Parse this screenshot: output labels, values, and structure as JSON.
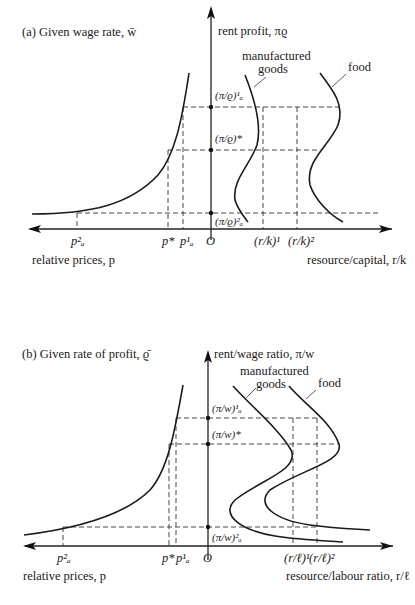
{
  "panel_a": {
    "title": "(a)  Given wage rate, w̄",
    "y_axis_label": "rent profit, πϱ",
    "x_right_label": "resource/capital, r/k",
    "x_left_label": "relative prices, p",
    "origin": "O",
    "curve_labels": {
      "manufactured_line1": "manufactured",
      "manufactured_line2": "goods",
      "food": "food"
    },
    "y_levels": {
      "upper": "(π/ϱ)¹ₐ",
      "star": "(π/ϱ)*",
      "lower": "(π/ϱ)²ₐ"
    },
    "x_left_ticks": {
      "pa2": "p²ₐ",
      "pstar": "p*",
      "pa1": "p¹ₐ"
    },
    "x_right_ticks": {
      "t1": "(r/k)¹",
      "t2": "(r/k)²"
    }
  },
  "panel_b": {
    "title": "(b)  Given rate of profit, ϱ̄",
    "y_axis_label": "rent/wage ratio, π/w",
    "x_right_label": "resource/labour ratio, r/ℓ",
    "x_left_label": "relative prices, p",
    "origin": "O",
    "curve_labels": {
      "manufactured_line1": "manufactured",
      "manufactured_line2": "goods",
      "food": "food"
    },
    "y_levels": {
      "upper": "(π/w)¹ₐ",
      "star": "(π/w)*",
      "lower": "(π/w)²ₐ"
    },
    "x_left_ticks": {
      "pa2": "p²ₐ",
      "pstar": "p*",
      "pa1": "p¹ₐ"
    },
    "x_right_ticks": {
      "t1": "(r/ℓ)¹",
      "t2": "(r/ℓ)²"
    }
  }
}
